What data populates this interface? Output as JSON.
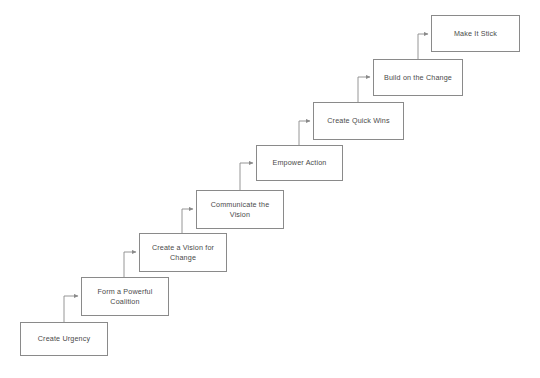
{
  "diagram": {
    "type": "flowchart-staircase",
    "title": "",
    "background_color": "#ffffff",
    "box_border_color": "#8a8a8a",
    "box_fill_color": "#ffffff",
    "connector_color": "#8a8a8a",
    "text_color": "#4a4a4a",
    "nodes": [
      {
        "id": "step-1",
        "label": "Create Urgency",
        "x": 20,
        "y": 322,
        "width": 88,
        "height": 34
      },
      {
        "id": "step-2",
        "label": "Form a Powerful\nCoalition",
        "x": 81,
        "y": 277,
        "width": 88,
        "height": 39
      },
      {
        "id": "step-3",
        "label": "Create a Vision for\nChange",
        "x": 139,
        "y": 233,
        "width": 88,
        "height": 39
      },
      {
        "id": "step-4",
        "label": "Communicate the\nVision",
        "x": 196,
        "y": 190,
        "width": 88,
        "height": 39
      },
      {
        "id": "step-5",
        "label": "Empower Action",
        "x": 256,
        "y": 145,
        "width": 87,
        "height": 36
      },
      {
        "id": "step-6",
        "label": "Create Quick Wins",
        "x": 313,
        "y": 102,
        "width": 91,
        "height": 38
      },
      {
        "id": "step-7",
        "label": "Build on the Change",
        "x": 373,
        "y": 59,
        "width": 90,
        "height": 37
      },
      {
        "id": "step-8",
        "label": "Make It Stick",
        "x": 431,
        "y": 15,
        "width": 89,
        "height": 37
      }
    ],
    "connectors": [
      {
        "id": "connector-1-2",
        "from": "step-1",
        "to": "step-2",
        "path": "M 64 322 L 64 296 L 78 296",
        "arrow_at": [
          81,
          296
        ]
      },
      {
        "id": "connector-2-3",
        "from": "step-2",
        "to": "step-3",
        "path": "M 124 277 L 124 252 L 136 252",
        "arrow_at": [
          139,
          252
        ]
      },
      {
        "id": "connector-3-4",
        "from": "step-3",
        "to": "step-4",
        "path": "M 182 233 L 182 209 L 193 209",
        "arrow_at": [
          196,
          209
        ]
      },
      {
        "id": "connector-4-5",
        "from": "step-4",
        "to": "step-5",
        "path": "M 240 190 L 240 163 L 253 163",
        "arrow_at": [
          256,
          163
        ]
      },
      {
        "id": "connector-5-6",
        "from": "step-5",
        "to": "step-6",
        "path": "M 299 145 L 299 121 L 310 121",
        "arrow_at": [
          313,
          121
        ]
      },
      {
        "id": "connector-6-7",
        "from": "step-6",
        "to": "step-7",
        "path": "M 358 102 L 358 77 L 370 77",
        "arrow_at": [
          373,
          77
        ]
      },
      {
        "id": "connector-7-8",
        "from": "step-7",
        "to": "step-8",
        "path": "M 418 59 L 418 34 L 428 34",
        "arrow_at": [
          431,
          34
        ]
      }
    ]
  }
}
